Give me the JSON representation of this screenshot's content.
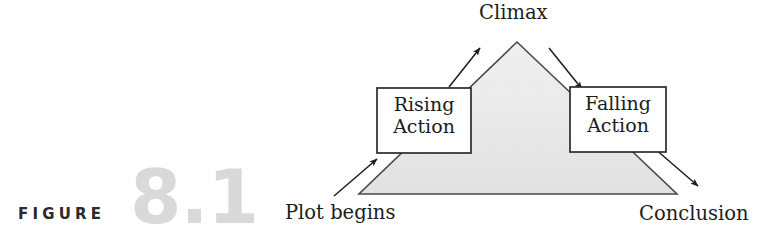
{
  "figure": {
    "caption_word": "FIGURE",
    "caption_number": "8.1"
  },
  "diagram": {
    "type": "plot-structure-diagram",
    "labels": {
      "climax": "Climax",
      "plot_begins": "Plot begins",
      "conclusion": "Conclusion",
      "rising_action_line1": "Rising",
      "rising_action_line2": "Action",
      "falling_action_line1": "Falling",
      "falling_action_line2": "Action"
    },
    "colors": {
      "triangle_fill": "#e3e3e3",
      "triangle_stroke": "#4a4a4a",
      "box_fill": "#ffffff",
      "box_stroke": "#2b2b2b",
      "arrow_stroke": "#1c1c1c",
      "text": "#1c1c1c",
      "caption_word": "#2a2a2a",
      "caption_number": "#d9d9d9"
    },
    "geometry": {
      "triangle_apex": [
        517,
        42
      ],
      "triangle_bottom_left": [
        359,
        194
      ],
      "triangle_bottom_right": [
        677,
        194
      ],
      "rising_box": [
        377,
        88,
        94,
        65
      ],
      "falling_box": [
        570,
        87,
        96,
        65
      ]
    },
    "arrows": [
      {
        "name": "plot-begins-arrow",
        "from": [
          334,
          196
        ],
        "to": [
          378,
          158
        ]
      },
      {
        "name": "rising-to-climax-arrow",
        "from": [
          449,
          86
        ],
        "to": [
          481,
          47
        ]
      },
      {
        "name": "climax-to-falling-arrow",
        "from": [
          549,
          48
        ],
        "to": [
          583,
          89
        ]
      },
      {
        "name": "falling-to-conclusion-arrow",
        "from": [
          654,
          148
        ],
        "to": [
          699,
          187
        ]
      }
    ]
  }
}
